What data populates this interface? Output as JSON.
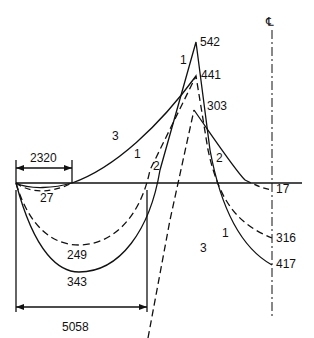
{
  "diagram": {
    "centerline_symbol": "℄",
    "peak_labels": {
      "p542": "542",
      "p441": "441",
      "p303": "303"
    },
    "right_labels": {
      "r17": "17",
      "r316": "316",
      "r417": "417"
    },
    "min_labels": {
      "m27": "27",
      "m249": "249",
      "m343": "343"
    },
    "dimensions": {
      "d2320": "2320",
      "d5058": "5058"
    },
    "curve_labels": {
      "c3_left": "3",
      "c1_upper": "1",
      "c1_mid": "1",
      "c2_mid": "2",
      "c2_right": "2",
      "c3_right": "3",
      "c1_right": "1"
    },
    "colors": {
      "line": "#111111",
      "background": "#ffffff"
    }
  }
}
